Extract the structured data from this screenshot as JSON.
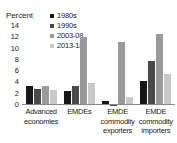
{
  "chart_data": {
    "type": "bar",
    "title": "",
    "subtitle": "",
    "xlabel": "",
    "ylabel": "Percent",
    "ylim": [
      0,
      14
    ],
    "yticks": [
      0,
      2,
      4,
      6,
      8,
      10,
      12,
      14
    ],
    "grid": false,
    "legend_position": "top-left-inside",
    "categories": [
      "Advanced economies",
      "EMDEs",
      "EMDE commodity exporters",
      "EMDE commodity importers"
    ],
    "series": [
      {
        "name": "1980s",
        "color": "#161616",
        "values": [
          3.3,
          2.4,
          0.8,
          4.3
        ]
      },
      {
        "name": "1990s",
        "color": "#4a4a4a",
        "values": [
          2.9,
          3.3,
          0.05,
          7.8
        ]
      },
      {
        "name": "2003-08",
        "color": "#9a9a9a",
        "values": [
          3.3,
          12.0,
          11.2,
          12.6
        ]
      },
      {
        "name": "2013-18",
        "color": "#c9c9c9",
        "values": [
          2.7,
          3.9,
          1.5,
          5.5
        ]
      }
    ]
  },
  "axis": {
    "ylabel": "Percent",
    "ytick_labels": [
      "14",
      "12",
      "10",
      "8",
      "6",
      "4",
      "2",
      "0"
    ]
  },
  "legend": {
    "items": [
      {
        "label": "1980s"
      },
      {
        "label": "1990s"
      },
      {
        "label": "2003-08"
      },
      {
        "label": "2013-18"
      }
    ]
  },
  "xlabels": [
    "Advanced economies",
    "EMDEs",
    "EMDE commodity exporters",
    "EMDE commodity importers"
  ]
}
